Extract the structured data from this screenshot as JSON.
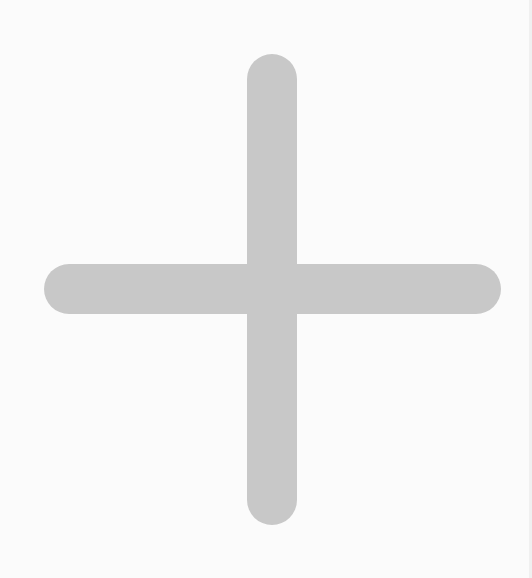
{
  "icon": {
    "name": "plus-icon",
    "color": "#c8c8c8"
  },
  "background": {
    "color": "#fbfbfb"
  }
}
